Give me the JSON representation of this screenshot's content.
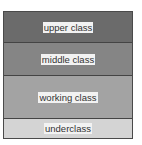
{
  "diagram": {
    "type": "stacked-layers",
    "bands": [
      {
        "label": "upper class",
        "color": "#6b6b6b",
        "top": 0,
        "height": 30
      },
      {
        "label": "middle class",
        "color": "#858585",
        "top": 30,
        "height": 33
      },
      {
        "label": "working class",
        "color": "#a3a3a3",
        "top": 63,
        "height": 43
      },
      {
        "label": "underclass",
        "color": "#d4d4d4",
        "top": 106,
        "height": 20
      }
    ]
  }
}
